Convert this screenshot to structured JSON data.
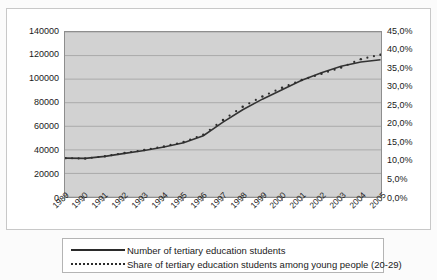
{
  "chart_data": {
    "type": "line",
    "title": "",
    "subtitle": "",
    "xlabel": "",
    "ylabel": "",
    "grid": true,
    "legend_position": "bottom",
    "categories": [
      "1989",
      "1990",
      "1991",
      "1992",
      "1993",
      "1994",
      "1995",
      "1996",
      "1997",
      "1998",
      "1999",
      "2000",
      "2001",
      "2002",
      "2003",
      "2004",
      "2005"
    ],
    "x": [
      1989,
      1990,
      1991,
      1992,
      1993,
      1994,
      1995,
      1996,
      1997,
      1998,
      1999,
      2000,
      2001,
      2002,
      2003,
      2004,
      2005
    ],
    "axes": {
      "left": {
        "ticks": [
          "0",
          "20000",
          "40000",
          "60000",
          "80000",
          "100000",
          "120000",
          "140000"
        ],
        "values": [
          0,
          20000,
          40000,
          60000,
          80000,
          100000,
          120000,
          140000
        ],
        "ylim": [
          0,
          140000
        ]
      },
      "right": {
        "ticks": [
          "0,0%",
          "5,0%",
          "10,0%",
          "15,0%",
          "20,0%",
          "25,0%",
          "30,0%",
          "35,0%",
          "40,0%",
          "45,0%"
        ],
        "values": [
          0,
          5,
          10,
          15,
          20,
          25,
          30,
          35,
          40,
          45
        ],
        "ylim": [
          0,
          45
        ]
      }
    },
    "series": [
      {
        "name": "Number of tertiary education students",
        "axis": "left",
        "style": "solid",
        "color": "#333333",
        "values": [
          33000,
          32800,
          34500,
          37000,
          39500,
          42500,
          46000,
          52000,
          63500,
          74000,
          83000,
          91000,
          99000,
          105500,
          111000,
          114500,
          116500
        ]
      },
      {
        "name": "Share of tertiary education students among young people (20-29)",
        "axis": "right",
        "style": "dotted",
        "color": "#2e2e2e",
        "values": [
          10.6,
          10.5,
          11.1,
          12.0,
          12.8,
          13.8,
          15.0,
          17.0,
          21.0,
          24.6,
          27.4,
          29.8,
          31.9,
          33.6,
          35.3,
          37.6,
          38.8
        ]
      }
    ],
    "legend": [
      {
        "label": "Number of tertiary education students",
        "style": "solid"
      },
      {
        "label": "Share of tertiary education students among young people (20-29)",
        "style": "dotted"
      }
    ]
  }
}
